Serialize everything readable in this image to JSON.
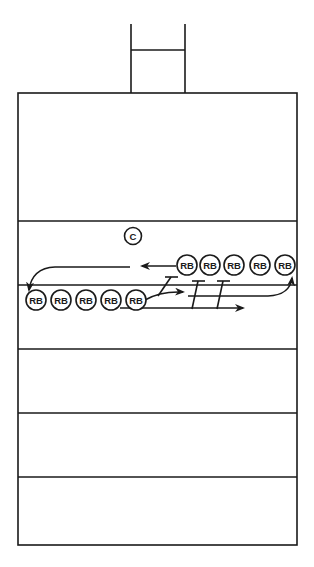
{
  "diagram": {
    "colors": {
      "stroke": "#1a1a1a",
      "background": "#ffffff"
    },
    "goalpost": {
      "left_x": 131,
      "right_x": 185,
      "top_y": 24,
      "crossbar_y": 50,
      "bottom_y": 92
    },
    "field": {
      "left": 18,
      "right": 297,
      "top": 93,
      "bottom": 545
    },
    "yard_lines_y": [
      221,
      285,
      349,
      413,
      477
    ],
    "line_of_scrimmage_y": 285,
    "coach": {
      "label": "C",
      "x": 133,
      "y": 236
    },
    "top_row": {
      "y": 265,
      "players": [
        {
          "label": "RB",
          "x": 187
        },
        {
          "label": "RB",
          "x": 210
        },
        {
          "label": "RB",
          "x": 234
        },
        {
          "label": "RB",
          "x": 260
        },
        {
          "label": "RB",
          "x": 285
        }
      ]
    },
    "bottom_row": {
      "y": 300,
      "players": [
        {
          "label": "RB",
          "x": 36
        },
        {
          "label": "RB",
          "x": 61
        },
        {
          "label": "RB",
          "x": 86
        },
        {
          "label": "RB",
          "x": 111
        },
        {
          "label": "RB",
          "x": 136
        }
      ]
    },
    "routes": [
      {
        "name": "top-row-left-return",
        "description": "From front top RB, run left then curve down to bottom row start"
      },
      {
        "name": "bottom-row-run-through",
        "description": "From front bottom RB, arrows run right through blockers"
      },
      {
        "name": "bottom-row-loop-to-top",
        "description": "Curve right along scrimmage line up to back of top row"
      }
    ],
    "blockers": [
      {
        "top_x": 172,
        "top_y": 276,
        "bottom_x": 160,
        "bottom_y": 296
      },
      {
        "top_x": 198,
        "top_y": 282,
        "bottom_x": 192,
        "bottom_y": 308
      },
      {
        "top_x": 223,
        "top_y": 282,
        "bottom_x": 217,
        "bottom_y": 308
      }
    ]
  }
}
